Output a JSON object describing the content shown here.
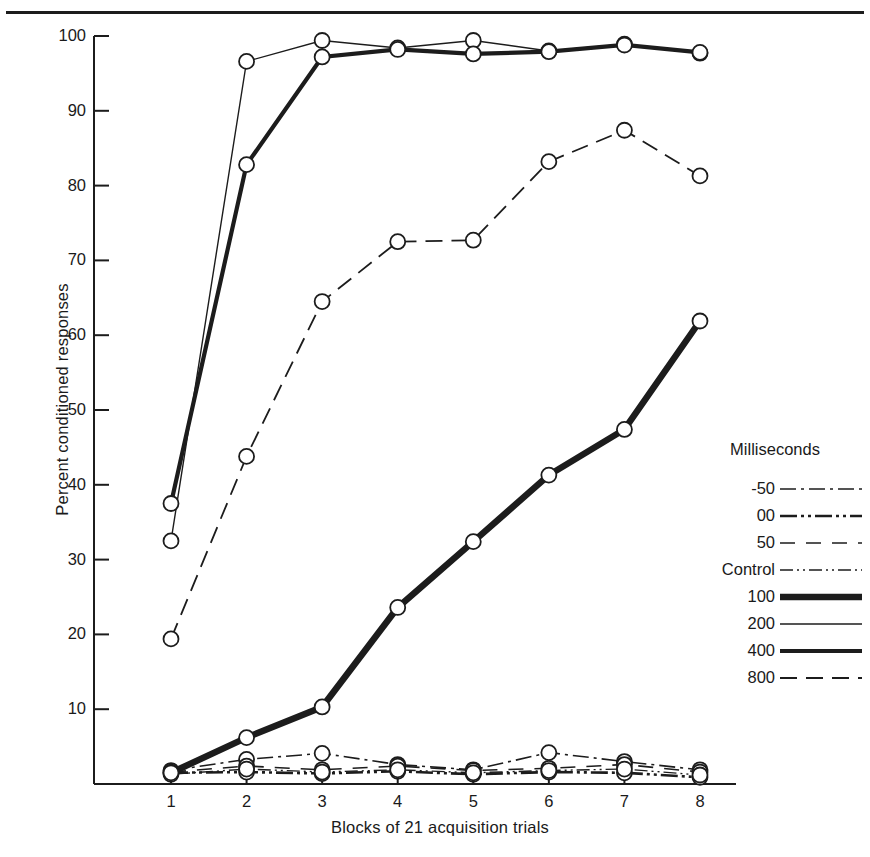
{
  "chart_data": {
    "type": "line",
    "title": "",
    "xlabel": "Blocks of 21 acquisition trials",
    "ylabel": "Percent conditioned responses",
    "legend_title": "Milliseconds",
    "legend_position": "right",
    "grid": false,
    "x": [
      1,
      2,
      3,
      4,
      5,
      6,
      7,
      8
    ],
    "xtick_labels": [
      "1",
      "2",
      "3",
      "4",
      "5",
      "6",
      "7",
      "8"
    ],
    "ytick_labels": [
      "100",
      "90",
      "80",
      "70",
      "60",
      "50",
      "40",
      "30",
      "20",
      "10"
    ],
    "ytick_values": [
      100,
      90,
      80,
      70,
      60,
      50,
      40,
      30,
      20,
      10
    ],
    "xlim": [
      0.6,
      8.4
    ],
    "ylim": [
      0,
      100
    ],
    "markers": "open-circle",
    "series": [
      {
        "name": "-50",
        "style": "dash-dot",
        "width": 1.6,
        "values": [
          1.8,
          3.3,
          4.1,
          2.6,
          1.9,
          4.2,
          3.0,
          1.9
        ]
      },
      {
        "name": "00",
        "style": "dash-dot-dot",
        "width": 2.6,
        "values": [
          1.5,
          1.6,
          1.4,
          1.7,
          1.3,
          1.6,
          1.5,
          0.9
        ]
      },
      {
        "name": "50",
        "style": "dashed-long",
        "width": 1.6,
        "values": [
          1.6,
          2.4,
          1.9,
          2.4,
          1.8,
          2.1,
          2.6,
          1.6
        ]
      },
      {
        "name": "Control",
        "style": "dash-dot-fine",
        "width": 1.4,
        "values": [
          1.3,
          2.0,
          1.6,
          1.9,
          1.5,
          1.8,
          2.0,
          1.2
        ]
      },
      {
        "name": "100",
        "style": "solid-very-thick",
        "width": 6.5,
        "values": [
          1.5,
          6.2,
          10.3,
          23.6,
          32.4,
          41.3,
          47.4,
          61.9
        ]
      },
      {
        "name": "200",
        "style": "solid-thin",
        "width": 1.4,
        "values": [
          32.5,
          96.6,
          99.4,
          98.4,
          99.4,
          98.0,
          98.9,
          97.7
        ]
      },
      {
        "name": "400",
        "style": "solid-thick",
        "width": 4.2,
        "values": [
          37.5,
          82.8,
          97.2,
          98.2,
          97.6,
          97.9,
          98.8,
          97.8
        ]
      },
      {
        "name": "800",
        "style": "dashed",
        "width": 1.8,
        "values": [
          19.4,
          43.8,
          64.5,
          72.5,
          72.7,
          83.2,
          87.4,
          81.3
        ]
      }
    ]
  }
}
